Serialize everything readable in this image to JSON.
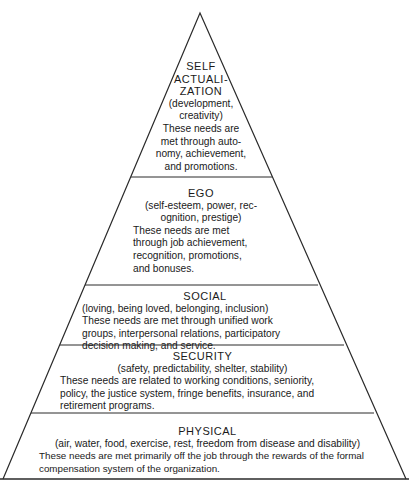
{
  "diagram": {
    "type": "hierarchy-pyramid",
    "tiers": [
      {
        "title": "SELF ACTUALI- ZATION",
        "title_lines": [
          "SELF",
          "ACTUALI-",
          "ZATION"
        ],
        "description": "(development, creativity)",
        "description_lines": [
          "(development,",
          "creativity)"
        ],
        "body": "These needs are met through autonomy, achievement, and promotions.",
        "body_lines": [
          "These needs are",
          "met through auto-",
          "nomy, achievement,",
          "and promotions."
        ]
      },
      {
        "title": "EGO",
        "description": "(self-esteem, power, recognition, prestige)",
        "description_lines": [
          "(self-esteem, power, rec-",
          "ognition, prestige)"
        ],
        "body": "These needs are met through job achievement, recognition, promotions, and bonuses.",
        "body_lines": [
          "These needs are met",
          "through job achievement,",
          "recognition, promotions,",
          "and bonuses."
        ]
      },
      {
        "title": "SOCIAL",
        "description": "(loving, being loved, belonging, inclusion)",
        "body": "These needs are met through unified work groups, interpersonal relations, participatory decision making, and service.",
        "body_lines": [
          "These needs are met through unified work",
          "groups, interpersonal relations, participatory",
          "decision making, and service."
        ]
      },
      {
        "title": "SECURITY",
        "description": "(safety, predictability, shelter, stability)",
        "body": "These needs are related to working conditions, seniority, policy, the justice system, fringe benefits, insurance, and retirement programs.",
        "body_lines": [
          "These needs are related to working conditions, seniority,",
          "policy, the justice system, fringe benefits, insurance, and",
          "retirement programs."
        ]
      },
      {
        "title": "PHYSICAL",
        "description": "(air, water, food, exercise, rest, freedom from disease and disability)",
        "body": "These needs are met primarily off the job through the rewards of the formal compensation system of the organization.",
        "body_lines": [
          "These needs are met primarily off the job through the rewards of the formal",
          "compensation system of the organization."
        ]
      }
    ]
  }
}
